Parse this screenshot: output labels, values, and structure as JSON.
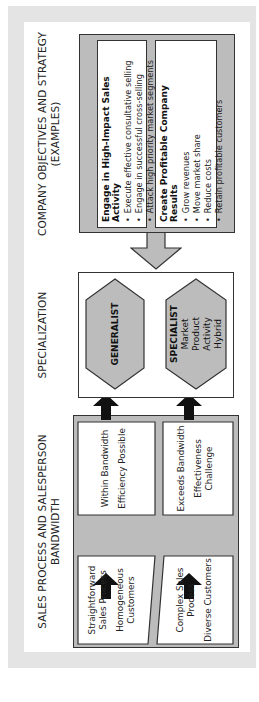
{
  "headings": {
    "sales": "SALES PROCESS AND SALESPERSON BANDWIDTH",
    "specialization": "SPECIALIZATION",
    "objectives_line1": "COMPANY OBJECTIVES AND STRATEGY",
    "objectives_line2": "(EXAMPLES)"
  },
  "objectives": [
    {
      "title": "Engage in High-Impact Sales Activity",
      "items": [
        "Execute effective consultative selling",
        "Engage in successful cross-selling",
        "Attack high priority market segments"
      ]
    },
    {
      "title": "Create Profitable Company Results",
      "items": [
        "Grow revenues",
        "Move market share",
        "Reduce costs",
        "Retain profitable customers"
      ]
    }
  ],
  "specialization": {
    "generalist": "GENERALIST",
    "specialist": {
      "title": "SPECIALIST",
      "types": [
        "Market",
        "Product",
        "Activity",
        "Hybrid"
      ]
    }
  },
  "sales": {
    "simple": {
      "input": [
        "Straightforward Sales Process",
        "Homogeneous Customers"
      ],
      "outcome": [
        "Within Bandwidth",
        "Efficiency Possible"
      ]
    },
    "complex": {
      "input": [
        "Complex Sales Process",
        "Diverse Customers"
      ],
      "outcome": [
        "Exceeds Bandwidth",
        "Effectiveness Challenge"
      ]
    }
  },
  "colors": {
    "panel_gray": "#bcbcbc",
    "frame_gray": "#e4e4e4",
    "arrow_black": "#111111",
    "border": "#333333"
  }
}
